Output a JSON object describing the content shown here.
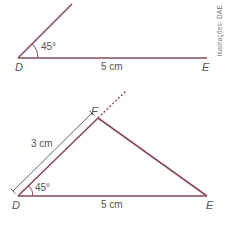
{
  "credit": "Ilustrações: DAE",
  "colors": {
    "segment": "#8a4a55",
    "measure": "#555555",
    "text": "#555555"
  },
  "top_figure": {
    "angle_label": "45°",
    "vertex_D": "D",
    "vertex_E": "E",
    "base_length": "5 cm"
  },
  "bottom_figure": {
    "angle_label": "45°",
    "vertex_D": "D",
    "vertex_E": "E",
    "vertex_F": "F",
    "base_length": "5 cm",
    "side_DF_length": "3 cm"
  }
}
